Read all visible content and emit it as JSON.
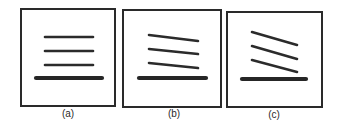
{
  "figure": {
    "line_color": "#2a2a2a",
    "background": "#ffffff",
    "panels": [
      {
        "id": "a",
        "label": "(a)",
        "thin_line_tilt": "horizontal",
        "thin_line_count": 3,
        "has_base_line": true
      },
      {
        "id": "b",
        "label": "(b)",
        "thin_line_tilt": "slight downward slope",
        "thin_line_count": 3,
        "has_base_line": true
      },
      {
        "id": "c",
        "label": "(c)",
        "thin_line_tilt": "steeper downward slope",
        "thin_line_count": 3,
        "has_base_line": true
      }
    ]
  }
}
